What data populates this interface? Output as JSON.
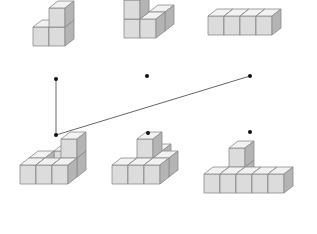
{
  "diagram": {
    "colors": {
      "front": "#dcdcdc",
      "top": "#f2f2f2",
      "side": "#b4b4b4",
      "edge": "#8a8a8a",
      "line": "#555555",
      "dot": "#111111"
    },
    "cube": {
      "w": 16,
      "h": 19,
      "dx": 9,
      "dy": -7
    },
    "top_figures": [
      {
        "id": "top-1",
        "name": "L-shape-3-cubes",
        "origin": [
          33,
          46
        ],
        "cubes": [
          [
            0,
            0,
            0
          ],
          [
            1,
            0,
            0
          ],
          [
            1,
            0,
            1
          ]
        ]
      },
      {
        "id": "top-2",
        "name": "stepped-4-cubes",
        "origin": [
          124,
          38
        ],
        "cubes": [
          [
            1,
            1,
            0
          ],
          [
            0,
            0,
            0
          ],
          [
            0,
            0,
            1
          ],
          [
            1,
            0,
            0
          ]
        ]
      },
      {
        "id": "top-3",
        "name": "straight-4-cubes",
        "origin": [
          208,
          35
        ],
        "cubes": [
          [
            0,
            0,
            0
          ],
          [
            1,
            0,
            0
          ],
          [
            2,
            0,
            0
          ],
          [
            3,
            0,
            0
          ]
        ]
      }
    ],
    "bottom_figures": [
      {
        "id": "bottom-1",
        "name": "L-5-cubes-with-tower",
        "origin": [
          20,
          184
        ],
        "cubes": [
          [
            1,
            2,
            0
          ],
          [
            0,
            1,
            0
          ],
          [
            2,
            1,
            0
          ],
          [
            0,
            0,
            0
          ],
          [
            1,
            0,
            0
          ],
          [
            2,
            0,
            0
          ],
          [
            2,
            1,
            1
          ]
        ]
      },
      {
        "id": "bottom-2",
        "name": "pyramid-like-cubes",
        "origin": [
          112,
          184
        ],
        "cubes": [
          [
            2,
            1,
            0
          ],
          [
            1,
            2,
            0
          ],
          [
            2,
            0,
            0
          ],
          [
            1,
            1,
            0
          ],
          [
            0,
            0,
            0
          ],
          [
            1,
            0,
            0
          ],
          [
            1,
            1,
            1
          ]
        ]
      },
      {
        "id": "bottom-3",
        "name": "long-base-with-tower",
        "origin": [
          204,
          193
        ],
        "cubes": [
          [
            1,
            1,
            0
          ],
          [
            0,
            0,
            0
          ],
          [
            1,
            0,
            0
          ],
          [
            2,
            0,
            0
          ],
          [
            3,
            0,
            0
          ],
          [
            4,
            0,
            0
          ],
          [
            1,
            1,
            1
          ]
        ]
      }
    ],
    "dots": {
      "top": [
        [
          56,
          79
        ],
        [
          147,
          76
        ],
        [
          250,
          76
        ]
      ],
      "bottom": [
        [
          56,
          135
        ],
        [
          148,
          133
        ],
        [
          250,
          132
        ]
      ]
    },
    "connections": [
      {
        "from": [
          56,
          79
        ],
        "to": [
          56,
          135
        ]
      },
      {
        "from": [
          56,
          135
        ],
        "to": [
          250,
          76
        ]
      }
    ]
  }
}
